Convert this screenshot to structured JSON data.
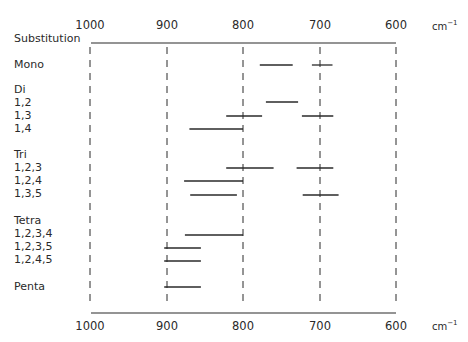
{
  "chart_data": {
    "type": "range-bar",
    "title": "",
    "xlabel": "cm⁻¹",
    "ylabel": "Substitution",
    "x_unit": "cm-1",
    "xlim": [
      1000,
      600
    ],
    "x_reversed": true,
    "x_ticks": [
      1000,
      900,
      800,
      700,
      600
    ],
    "grid": {
      "dashed_vertical_lines_at": [
        1000,
        900,
        800,
        700,
        600
      ]
    },
    "rows": [
      {
        "label": "Mono",
        "group_header": false,
        "ranges": [
          [
            778,
            735
          ],
          [
            710,
            683
          ]
        ]
      },
      {
        "label": "Di",
        "group_header": true,
        "ranges": []
      },
      {
        "label": "1,2",
        "group_header": false,
        "ranges": [
          [
            770,
            728
          ]
        ]
      },
      {
        "label": "1,3",
        "group_header": false,
        "ranges": [
          [
            822,
            775
          ],
          [
            723,
            682
          ]
        ]
      },
      {
        "label": "1,4",
        "group_header": false,
        "ranges": [
          [
            870,
            800
          ]
        ]
      },
      {
        "label": "Tri",
        "group_header": true,
        "ranges": []
      },
      {
        "label": "1,2,3",
        "group_header": false,
        "ranges": [
          [
            822,
            760
          ],
          [
            730,
            682
          ]
        ]
      },
      {
        "label": "1,2,4",
        "group_header": false,
        "ranges": [
          [
            877,
            800
          ]
        ]
      },
      {
        "label": "1,3,5",
        "group_header": false,
        "ranges": [
          [
            869,
            808
          ],
          [
            722,
            675
          ]
        ]
      },
      {
        "label": "Tetra",
        "group_header": true,
        "ranges": []
      },
      {
        "label": "1,2,3,4",
        "group_header": false,
        "ranges": [
          [
            876,
            800
          ]
        ]
      },
      {
        "label": "1,2,3,5",
        "group_header": false,
        "ranges": [
          [
            903,
            855
          ]
        ]
      },
      {
        "label": "1,2,4,5",
        "group_header": false,
        "ranges": [
          [
            903,
            855
          ]
        ]
      },
      {
        "label": "Penta",
        "group_header": false,
        "ranges": [
          [
            903,
            855
          ]
        ]
      }
    ]
  },
  "labels": {
    "header": "Substitution",
    "unit_base": "cm",
    "unit_exp": "−1",
    "ticks": [
      "1000",
      "900",
      "800",
      "700",
      "600"
    ],
    "rows": [
      "Mono",
      "Di",
      "1,2",
      "1,3",
      "1,4",
      "Tri",
      "1,2,3",
      "1,2,4",
      "1,3,5",
      "Tetra",
      "1,2,3,4",
      "1,2,3,5",
      "1,2,4,5",
      "Penta"
    ]
  },
  "colors": {
    "ink": "#2a2a2a",
    "background": "#ffffff"
  }
}
